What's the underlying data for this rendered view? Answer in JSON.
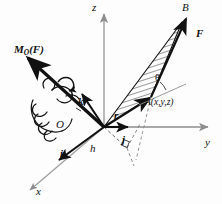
{
  "figure": {
    "type": "vector-mechanics-diagram",
    "background": "#fdfdfd",
    "ink": "#111111",
    "axis_color": "#9a9a9a",
    "width": 222,
    "height": 204
  },
  "labels": {
    "axis_z": "z",
    "axis_y": "y",
    "axis_x": "x",
    "origin": "O",
    "point_B": "B",
    "force": "F",
    "moment_main": "M",
    "moment_sub": "O",
    "moment_arg": "(F)",
    "point_A": "A(x,y,z)",
    "position_vector": "r",
    "unit_k": "k",
    "unit_i": "i",
    "unit_j": "j",
    "moment_arm": "h",
    "angle": "θ"
  },
  "elements": {
    "hatched_area": "triangle-OAB",
    "hand": "right-hand-rule-grip",
    "right_angle_mark": "perpendicular-at-foot-of-h",
    "curved_arrow": "rotation-sense-arrow"
  }
}
